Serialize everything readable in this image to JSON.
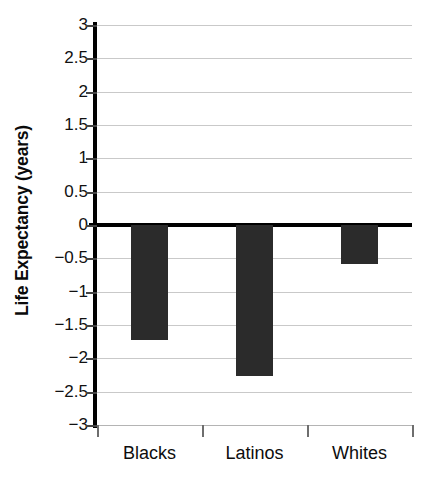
{
  "chart_data": {
    "type": "bar",
    "title": "",
    "xlabel": "",
    "ylabel": "Life Expectancy (years)",
    "categories": [
      "Blacks",
      "Latinos",
      "Whites"
    ],
    "values": [
      -1.72,
      -2.27,
      -0.58
    ],
    "series": [
      {
        "name": "Life Expectancy Change",
        "values": [
          -1.72,
          -2.27,
          -0.58
        ]
      }
    ],
    "ylim": [
      -3,
      3
    ],
    "ytick_labels": [
      "3",
      "2.5",
      "2",
      "1.5",
      "1",
      "0.5",
      "0",
      "−0.5",
      "−1",
      "−1.5",
      "−2",
      "−2.5",
      "−3"
    ],
    "ytick_values": [
      3,
      2.5,
      2,
      1.5,
      1,
      0.5,
      0,
      -0.5,
      -1,
      -1.5,
      -2,
      -2.5,
      -3
    ],
    "grid": true,
    "legend": "none",
    "bar_color": "#2b2b2b",
    "gridline_color": "#c9c9c9",
    "axis_color": "#000000",
    "background_color": "#ffffff"
  }
}
